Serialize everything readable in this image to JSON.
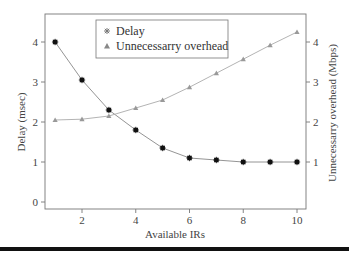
{
  "chart_data": {
    "type": "line",
    "title": "",
    "xlabel": "Available IRs",
    "ylabel": "Delay (msec)",
    "y2label": "Unnecessarry overhead (Mbps)",
    "x": [
      1,
      2,
      3,
      4,
      5,
      6,
      7,
      8,
      9,
      10
    ],
    "xticks": [
      2,
      4,
      6,
      8,
      10
    ],
    "yticks": [
      0,
      1,
      2,
      3,
      4
    ],
    "y2ticks": [
      1,
      2,
      3,
      4
    ],
    "xlim": [
      0.65,
      10.35
    ],
    "ylim": [
      -0.18,
      4.7
    ],
    "y2lim": [
      -0.18,
      4.7
    ],
    "grid": false,
    "legend_position": "upper center",
    "series": [
      {
        "name": "Delay",
        "axis": "left",
        "marker": "star",
        "color": "#111111",
        "line_color": "#888888",
        "values": [
          4.0,
          3.05,
          2.3,
          1.8,
          1.35,
          1.1,
          1.05,
          1.0,
          1.0,
          1.0
        ]
      },
      {
        "name": "Unnecessarry overhead",
        "axis": "right",
        "marker": "triangle",
        "color": "#999999",
        "line_color": "#aaaaaa",
        "values": [
          2.05,
          2.07,
          2.15,
          2.35,
          2.55,
          2.87,
          3.22,
          3.57,
          3.92,
          4.25
        ]
      }
    ]
  },
  "legend": {
    "items": [
      {
        "label": "Delay",
        "icon": "star-marker"
      },
      {
        "label": "Unnecessarry overhead",
        "icon": "triangle-marker"
      }
    ]
  }
}
